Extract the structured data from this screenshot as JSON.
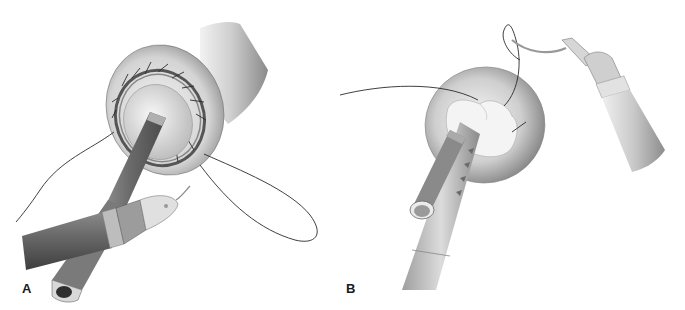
{
  "figure": {
    "panels": [
      {
        "label": "A",
        "depicts": "Circular anastomosis with interrupted sutures around a cylindrical rod; laparoscopic needle driver holding needle with looping suture thread"
      },
      {
        "label": "B",
        "depicts": "Dome-shaped tissue with purse-string closure around a grasper; curved needle held by a second instrument with suture passing through tissue"
      }
    ],
    "colors": {
      "background": "#ffffff",
      "tissue_light": "#e8e8e8",
      "tissue_mid": "#b8b8b8",
      "tissue_dark": "#6e6e6e",
      "instrument_dark": "#5a5a5a",
      "instrument_light": "#d0d0d0",
      "suture": "#2a2a2a",
      "label": "#1a1a1a"
    }
  }
}
